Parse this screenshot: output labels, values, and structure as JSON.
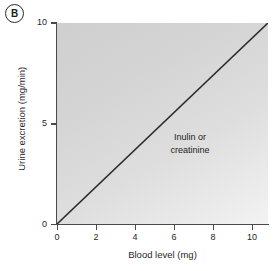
{
  "figure": {
    "panel_label": "B",
    "background_color": "#ffffff"
  },
  "chart_data": {
    "type": "line",
    "title": "",
    "subtitle": "",
    "xlabel": "Blood level (mg)",
    "ylabel": "Urine excretion (mg/min)",
    "xlim": [
      0,
      10.8
    ],
    "ylim": [
      0,
      10
    ],
    "xticks": [
      0,
      2,
      4,
      6,
      8,
      10
    ],
    "yticks": [
      0,
      5,
      10
    ],
    "xticklabels": [
      "0",
      "2",
      "4",
      "6",
      "8",
      "10"
    ],
    "yticklabels": [
      "0",
      "5",
      "10"
    ],
    "grid": false,
    "legend": null,
    "plot_background_color": "#d9d9d9",
    "series": [
      {
        "name": "Inulin or creatinine",
        "color": "#2a2a2a",
        "line_width": 1.6,
        "x": [
          0,
          10.8
        ],
        "y": [
          0,
          10
        ],
        "slope": 0.926,
        "intercept": 0
      }
    ],
    "annotations": [
      {
        "name": "curve-label",
        "lines": [
          "Inulin or",
          "creatinine"
        ],
        "x": 7.1,
        "y": 4.6
      }
    ]
  }
}
